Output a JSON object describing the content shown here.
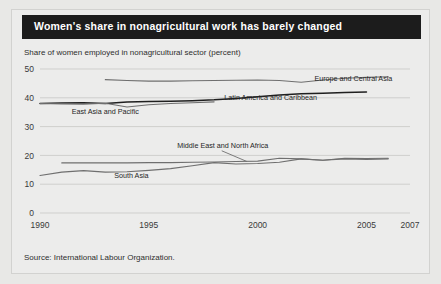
{
  "title": "Women's share in nonagricultural work has barely changed",
  "subtitle": "Share of women employed in nonagricultural sector (percent)",
  "source": "Source: International Labour Organization.",
  "colors": {
    "title_bar_bg": "#1c1c1c",
    "title_text": "#ffffff",
    "panel_bg": "#ececeb",
    "grid": "#cfcfcd",
    "line_dark": "#1f1f1f",
    "line_gray": "#6f6f6f",
    "axis_text": "#3a3a3a"
  },
  "chart_data": {
    "type": "line",
    "title": "Women's share in nonagricultural work has barely changed",
    "subtitle": "Share of women employed in nonagricultural sector (percent)",
    "xlabel": "",
    "ylabel": "Share of women employed in nonagricultural sector (percent)",
    "xlim": [
      1990,
      2007
    ],
    "ylim": [
      0,
      50
    ],
    "yticks": [
      0,
      10,
      20,
      30,
      40,
      50
    ],
    "xticks": [
      1990,
      1995,
      2000,
      2005,
      2007
    ],
    "ytick_labels": [
      "0",
      "10",
      "20",
      "30",
      "40",
      "50"
    ],
    "xtick_labels": [
      "1990",
      "1995",
      "2000",
      "2005",
      "2007"
    ],
    "grid": true,
    "legend": "inline-labels",
    "series": [
      {
        "name": "Europe and Central Asia",
        "color": "#6f6f6f",
        "label_x": 2004.4,
        "label_y": 46.0,
        "x": [
          1993,
          1994,
          1995,
          1996,
          1997,
          1998,
          1999,
          2000,
          2001,
          2002,
          2003,
          2004,
          2005,
          2006
        ],
        "y": [
          46.3,
          46.0,
          45.8,
          45.8,
          45.9,
          46.0,
          46.1,
          46.2,
          46.0,
          45.4,
          46.2,
          46.8,
          47.1,
          47.3
        ]
      },
      {
        "name": "Latin America and Caribbean",
        "color": "#1f1f1f",
        "label_x": 2000.6,
        "label_y": 39.3,
        "x": [
          1990,
          1991,
          1992,
          1993,
          1994,
          1995,
          1996,
          1997,
          1998,
          1999,
          2000,
          2001,
          2002,
          2003,
          2004,
          2005
        ],
        "y": [
          38.0,
          38.2,
          38.3,
          38.0,
          38.5,
          38.7,
          38.8,
          39.0,
          39.3,
          39.8,
          40.4,
          41.0,
          41.4,
          41.6,
          41.8,
          42.0
        ]
      },
      {
        "name": "East Asia and Pacific",
        "color": "#6f6f6f",
        "label_x": 1993.0,
        "label_y": 34.3,
        "x": [
          1990,
          1991,
          1992,
          1993,
          1994,
          1995,
          1996,
          1997,
          1998
        ],
        "y": [
          38.0,
          37.9,
          37.8,
          38.1,
          36.8,
          37.6,
          38.0,
          38.3,
          38.6
        ]
      },
      {
        "name": "Middle East and North Africa",
        "color": "#6f6f6f",
        "label_x": 1998.4,
        "label_y": 22.4,
        "x": [
          1991,
          1992,
          1993,
          1994,
          1995,
          1996,
          1997,
          1998,
          1999,
          2000,
          2001,
          2002,
          2003,
          2004,
          2005,
          2006
        ],
        "y": [
          17.4,
          17.4,
          17.4,
          17.4,
          17.5,
          17.5,
          17.6,
          17.7,
          17.9,
          18.0,
          19.0,
          18.8,
          18.3,
          18.8,
          18.6,
          18.8
        ]
      },
      {
        "name": "South Asia",
        "color": "#6f6f6f",
        "label_x": 1994.2,
        "label_y": 12.3,
        "x": [
          1990,
          1991,
          1992,
          1993,
          1994,
          1995,
          1996,
          1997,
          1998,
          1999,
          2000,
          2001,
          2002,
          2003,
          2004,
          2005,
          2006
        ],
        "y": [
          13.0,
          14.2,
          14.7,
          14.2,
          14.3,
          14.8,
          15.4,
          16.4,
          17.5,
          17.0,
          17.2,
          17.6,
          18.8,
          18.3,
          19.0,
          18.9,
          19.0
        ]
      }
    ]
  }
}
